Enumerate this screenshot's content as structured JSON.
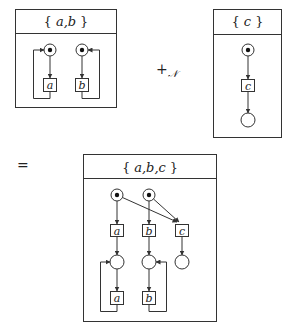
{
  "diagram": {
    "type": "petri-net-composition",
    "operator": "+",
    "operator_subscript": "𝒩",
    "equals": "=",
    "nets": [
      {
        "id": "net_ab",
        "title_open": "{",
        "title_vars": "a,b",
        "title_close": "}",
        "places": [
          {
            "id": "p_a",
            "marked": true
          },
          {
            "id": "p_b",
            "marked": true
          }
        ],
        "transitions": [
          {
            "id": "t_a",
            "label": "a"
          },
          {
            "id": "t_b",
            "label": "b"
          }
        ],
        "arcs": [
          [
            "p_a",
            "t_a"
          ],
          [
            "t_a",
            "p_a"
          ],
          [
            "p_b",
            "t_b"
          ],
          [
            "t_b",
            "p_b"
          ]
        ]
      },
      {
        "id": "net_c",
        "title_open": "{",
        "title_vars": "c",
        "title_close": "}",
        "places": [
          {
            "id": "p_c",
            "marked": true
          },
          {
            "id": "p_c_out",
            "marked": false
          }
        ],
        "transitions": [
          {
            "id": "t_c",
            "label": "c"
          }
        ],
        "arcs": [
          [
            "p_c",
            "t_c"
          ],
          [
            "t_c",
            "p_c_out"
          ]
        ]
      },
      {
        "id": "net_abc",
        "title_open": "{",
        "title_vars": "a,b,c",
        "title_close": "}",
        "places": [
          {
            "id": "p1",
            "marked": true
          },
          {
            "id": "p2",
            "marked": true
          },
          {
            "id": "p3",
            "marked": false
          },
          {
            "id": "p4",
            "marked": false
          },
          {
            "id": "p5",
            "marked": false
          }
        ],
        "transitions": [
          {
            "id": "t1",
            "label": "a"
          },
          {
            "id": "t2",
            "label": "b"
          },
          {
            "id": "t3",
            "label": "c"
          },
          {
            "id": "t4",
            "label": "a"
          },
          {
            "id": "t5",
            "label": "b"
          }
        ],
        "arcs": [
          [
            "p1",
            "t1"
          ],
          [
            "p2",
            "t2"
          ],
          [
            "p1",
            "t3"
          ],
          [
            "p2",
            "t3"
          ],
          [
            "t1",
            "p3"
          ],
          [
            "t2",
            "p4"
          ],
          [
            "t3",
            "p5"
          ],
          [
            "p3",
            "t4"
          ],
          [
            "t4",
            "p3"
          ],
          [
            "p4",
            "t5"
          ],
          [
            "t5",
            "p4"
          ]
        ]
      }
    ]
  }
}
